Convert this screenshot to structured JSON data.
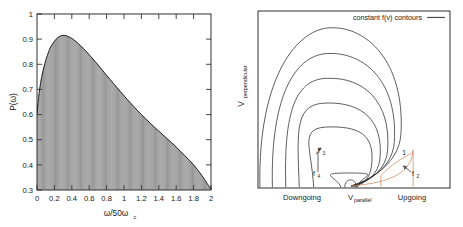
{
  "figure": {
    "background_color": "#ffffff",
    "ink_color": "#1a1a1a",
    "accent_color": "#c98a5e"
  },
  "left_panel": {
    "y_axis_title": "P(ω)",
    "x_axis_title_main": "ω/50ω",
    "x_axis_title_sub": "c"
  },
  "right_panel": {
    "y_axis_title": "V",
    "y_axis_title_sub": "perpendicular",
    "legend_label": "constant f(v) contours",
    "x_label_left": "Downgoing",
    "x_label_center_main": "V",
    "x_label_center_sub": "parallel",
    "x_label_right": "Upgoing",
    "annotations": [
      {
        "id": "a1",
        "label": "1",
        "sub": ""
      },
      {
        "id": "a2",
        "label": "f",
        "sub": "2"
      },
      {
        "id": "a3",
        "label": "f",
        "sub": "3"
      },
      {
        "id": "a4",
        "label": "f",
        "sub": "4"
      }
    ]
  },
  "chart_data": [
    {
      "type": "area",
      "id": "power-spectrum",
      "title": "",
      "xlabel": "ω/50ωc",
      "ylabel": "P(ω)",
      "xlim": [
        0,
        2
      ],
      "ylim": [
        0.3,
        1
      ],
      "xticks": [
        0,
        0.2,
        0.4,
        0.6,
        0.8,
        1,
        1.2,
        1.4,
        1.6,
        1.8,
        2
      ],
      "xticklabels": [
        "0",
        "0.2",
        "0.4",
        "0.6",
        "0.8",
        "1",
        "1.2",
        "1.4",
        "1.6",
        "1.8",
        "2"
      ],
      "yticks": [
        0.3,
        0.4,
        0.5,
        0.6,
        0.7,
        0.8,
        0.9,
        1
      ],
      "yticklabels": [
        "0.3",
        "0.4",
        "0.5",
        "0.6",
        "0.7",
        "0.8",
        "0.9",
        "1"
      ],
      "grid": false,
      "legend": "none",
      "fill_pattern": "vertical-line-hatch",
      "x": [
        0.0,
        0.02,
        0.04,
        0.06,
        0.08,
        0.1,
        0.14,
        0.18,
        0.22,
        0.26,
        0.3,
        0.34,
        0.38,
        0.42,
        0.46,
        0.5,
        0.56,
        0.62,
        0.68,
        0.74,
        0.8,
        0.88,
        0.96,
        1.04,
        1.12,
        1.2,
        1.3,
        1.4,
        1.5,
        1.6,
        1.7,
        1.8,
        1.9,
        2.0
      ],
      "y": [
        0.6,
        0.672,
        0.722,
        0.76,
        0.79,
        0.815,
        0.855,
        0.882,
        0.9,
        0.911,
        0.915,
        0.913,
        0.907,
        0.898,
        0.887,
        0.874,
        0.853,
        0.83,
        0.806,
        0.781,
        0.756,
        0.723,
        0.691,
        0.659,
        0.629,
        0.6,
        0.566,
        0.534,
        0.503,
        0.471,
        0.436,
        0.4,
        0.355,
        0.302
      ],
      "peak": {
        "x": 0.3,
        "y": 0.915
      },
      "start": {
        "x": 0.0,
        "y": 0.6
      },
      "end": {
        "x": 2.0,
        "y": 0.302
      }
    },
    {
      "type": "contour",
      "id": "velocity-distribution-contours",
      "title": "",
      "xlabel": "V parallel",
      "ylabel": "V perpendicular",
      "legend": [
        "constant f(v) contours"
      ],
      "legend_position": "top-right",
      "grid": false,
      "axis_ticks": false,
      "n_contours": 6,
      "contour_description": "nested loss-cone contours converging to a point on the V_parallel axis",
      "contour_levels": [
        1,
        2,
        3,
        4,
        5,
        6
      ],
      "annotation_points": [
        {
          "label": "1",
          "x": 0.74,
          "y": 0.2
        },
        {
          "label": "f2",
          "x": 0.78,
          "y": 0.075
        },
        {
          "label": "f3",
          "x": 0.345,
          "y": 0.215
        },
        {
          "label": "f4",
          "x": 0.325,
          "y": 0.075
        }
      ],
      "accent_curve": "resonance-ellipse-arc"
    }
  ]
}
